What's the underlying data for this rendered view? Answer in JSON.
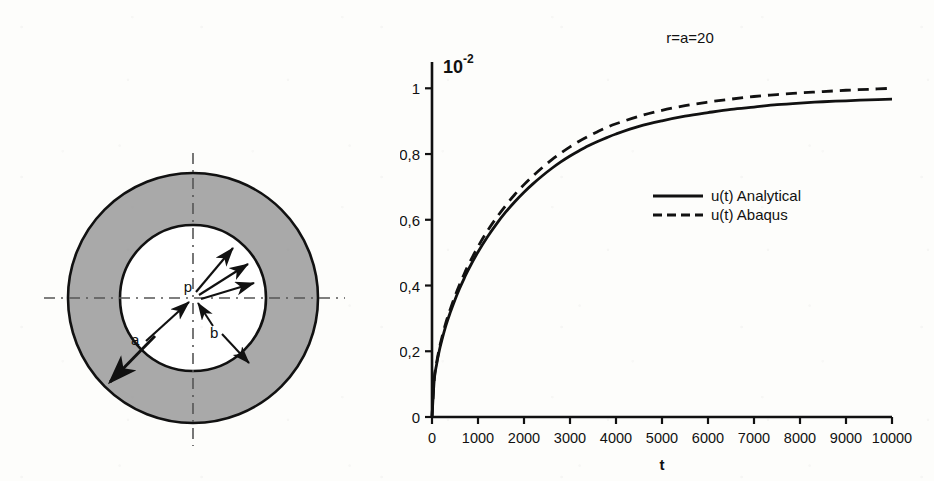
{
  "figure": {
    "background_color": "#fdfdfb",
    "ink_color": "#111111",
    "annulus_fill_color": "#a9a9a9"
  },
  "diagram": {
    "name": "thick-walled-annulus-cross-section",
    "labels": {
      "inner_radius": "a",
      "outer_radius_pointer": "b",
      "internal_pressure": "p"
    },
    "geometry": {
      "center_x": 193,
      "center_y": 298,
      "outer_radius": 125,
      "inner_radius": 73
    },
    "pressure_arrow_count": 3,
    "centerline_style": "dash-dot"
  },
  "chart_data": {
    "type": "line",
    "title": "r=a=20",
    "xlabel": "t",
    "ylabel": "",
    "y_scale_exponent_label": "10",
    "y_scale_exponent_superscript": "-2",
    "xlim": [
      0,
      10000
    ],
    "ylim": [
      0,
      1.08
    ],
    "grid": false,
    "legend_position": "center-right",
    "xticks": [
      0,
      1000,
      2000,
      3000,
      4000,
      5000,
      6000,
      7000,
      8000,
      9000,
      10000
    ],
    "xtick_labels": [
      "0",
      "1000",
      "2000",
      "3000",
      "4000",
      "5000",
      "6000",
      "7000",
      "8000",
      "9000",
      "10000"
    ],
    "yticks": [
      0,
      0.2,
      0.4,
      0.6,
      0.8,
      1.0
    ],
    "ytick_labels": [
      "0",
      "0,2",
      "0,4",
      "0,6",
      "0,8",
      "1"
    ],
    "x": [
      0,
      50,
      100,
      150,
      200,
      300,
      400,
      500,
      600,
      700,
      800,
      1000,
      1200,
      1400,
      1600,
      1800,
      2000,
      2200,
      2400,
      2600,
      2800,
      3000,
      3200,
      3400,
      3600,
      3800,
      4000,
      4500,
      5000,
      5500,
      6000,
      6500,
      7000,
      7500,
      8000,
      8500,
      9000,
      9500,
      10000
    ],
    "series": [
      {
        "name": "u(t) Analytical",
        "style": "solid",
        "values": [
          0.0,
          0.115,
          0.16,
          0.196,
          0.226,
          0.277,
          0.319,
          0.357,
          0.391,
          0.422,
          0.451,
          0.502,
          0.547,
          0.587,
          0.623,
          0.655,
          0.684,
          0.71,
          0.734,
          0.756,
          0.776,
          0.794,
          0.81,
          0.825,
          0.838,
          0.85,
          0.861,
          0.884,
          0.901,
          0.915,
          0.926,
          0.936,
          0.943,
          0.95,
          0.955,
          0.959,
          0.962,
          0.965,
          0.967
        ]
      },
      {
        "name": "u(t) Abaqus",
        "style": "dashed",
        "values": [
          0.0,
          0.118,
          0.165,
          0.202,
          0.233,
          0.286,
          0.329,
          0.368,
          0.403,
          0.435,
          0.465,
          0.518,
          0.565,
          0.606,
          0.643,
          0.677,
          0.707,
          0.734,
          0.759,
          0.782,
          0.803,
          0.822,
          0.839,
          0.854,
          0.868,
          0.881,
          0.892,
          0.915,
          0.933,
          0.947,
          0.958,
          0.967,
          0.975,
          0.981,
          0.986,
          0.99,
          0.994,
          0.997,
          1.0
        ]
      }
    ],
    "legend": [
      {
        "label": "u(t) Analytical",
        "style": "solid"
      },
      {
        "label": "u(t) Abaqus",
        "style": "dashed"
      }
    ]
  }
}
